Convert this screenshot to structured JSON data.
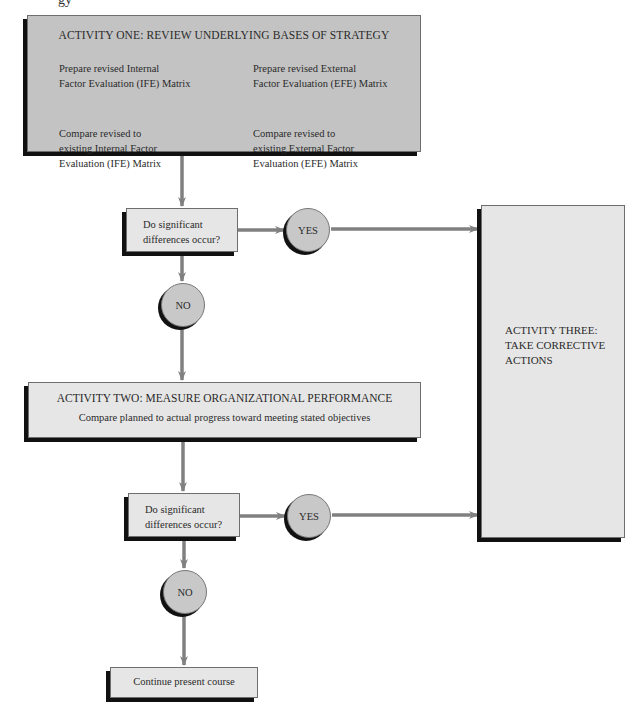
{
  "page_fragment": "gy",
  "activity_one": {
    "title": "ACTIVITY ONE: REVIEW UNDERLYING BASES OF STRATEGY",
    "cells": [
      {
        "line1": "Prepare revised Internal",
        "line2": "Factor Evaluation (IFE) Matrix",
        "line3": ""
      },
      {
        "line1": "Prepare revised External",
        "line2": "Factor Evaluation (EFE) Matrix",
        "line3": ""
      },
      {
        "line1": "Compare revised to",
        "line2": "existing Internal Factor",
        "line3": "Evaluation (IFE) Matrix"
      },
      {
        "line1": "Compare revised to",
        "line2": "existing External Factor",
        "line3": "Evaluation (EFE) Matrix"
      }
    ]
  },
  "decision_one": {
    "line1": "Do significant",
    "line2": "differences occur?",
    "yes": "YES",
    "no": "NO"
  },
  "activity_two": {
    "title": "ACTIVITY TWO: MEASURE ORGANIZATIONAL PERFORMANCE",
    "subtitle": "Compare planned to actual progress toward meeting stated objectives"
  },
  "decision_two": {
    "line1": "Do significant",
    "line2": "differences occur?",
    "yes": "YES",
    "no": "NO"
  },
  "activity_three": {
    "line1": "ACTIVITY THREE:",
    "line2": "TAKE CORRECTIVE",
    "line3": "ACTIONS"
  },
  "end_box": {
    "label": "Continue present course"
  },
  "colors": {
    "arrow": "#808080",
    "dark_box": "#c3c3c3",
    "light_box": "#e6e6e6",
    "circle": "#c8c8c8",
    "shadow": "#111111"
  }
}
